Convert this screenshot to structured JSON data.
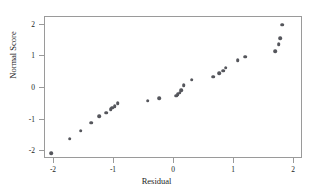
{
  "chart_data": {
    "type": "scatter",
    "title": "",
    "xlabel": "Residual",
    "ylabel": "Normal Score",
    "xlim": [
      -2.15,
      2.15
    ],
    "ylim": [
      -2.25,
      2.25
    ],
    "xticks": [
      -2,
      -1,
      0,
      1,
      2
    ],
    "xticklabels": [
      "-2",
      "-1",
      "0",
      "1",
      "2"
    ],
    "yticks": [
      -2,
      -1,
      0,
      1,
      2
    ],
    "yticklabels": [
      "-2",
      "-1",
      "0",
      "1",
      "2"
    ],
    "grid": false,
    "legend": null,
    "marker_color": "#55565c",
    "frame_color": "#9a9a9a",
    "points": [
      {
        "x": -2.03,
        "y": -2.09
      },
      {
        "x": -1.72,
        "y": -1.64
      },
      {
        "x": -1.54,
        "y": -1.38
      },
      {
        "x": -1.36,
        "y": -1.13
      },
      {
        "x": -1.23,
        "y": -0.92
      },
      {
        "x": -1.11,
        "y": -0.82
      },
      {
        "x": -1.04,
        "y": -0.7
      },
      {
        "x": -1.01,
        "y": -0.65
      },
      {
        "x": -0.97,
        "y": -0.6
      },
      {
        "x": -0.92,
        "y": -0.51
      },
      {
        "x": -0.42,
        "y": -0.43
      },
      {
        "x": -0.23,
        "y": -0.35
      },
      {
        "x": 0.05,
        "y": -0.27
      },
      {
        "x": 0.08,
        "y": -0.23
      },
      {
        "x": 0.11,
        "y": -0.18
      },
      {
        "x": 0.14,
        "y": -0.1
      },
      {
        "x": 0.18,
        "y": 0.06
      },
      {
        "x": 0.31,
        "y": 0.23
      },
      {
        "x": 0.67,
        "y": 0.33
      },
      {
        "x": 0.77,
        "y": 0.43
      },
      {
        "x": 0.84,
        "y": 0.52
      },
      {
        "x": 0.88,
        "y": 0.61
      },
      {
        "x": 1.08,
        "y": 0.84
      },
      {
        "x": 1.2,
        "y": 0.96
      },
      {
        "x": 1.7,
        "y": 1.13
      },
      {
        "x": 1.76,
        "y": 1.36
      },
      {
        "x": 1.79,
        "y": 1.54
      },
      {
        "x": 1.82,
        "y": 1.98
      }
    ]
  }
}
